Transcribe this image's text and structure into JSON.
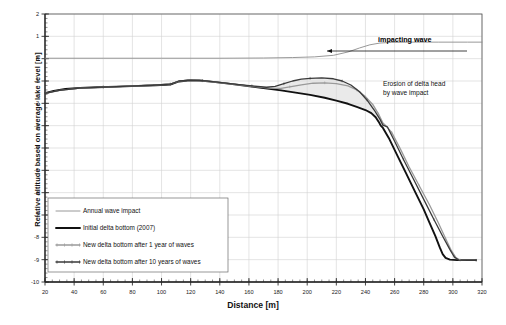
{
  "chart_data": {
    "type": "line",
    "title": "",
    "xlabel": "Distance [m]",
    "ylabel": "Relative altitude based on average lake level [m]",
    "xlim": [
      20,
      320
    ],
    "ylim": [
      -10,
      2
    ],
    "xticks": [
      20,
      40,
      60,
      80,
      100,
      120,
      140,
      160,
      180,
      200,
      220,
      240,
      260,
      280,
      300,
      320
    ],
    "yticks": [
      2,
      1,
      0,
      -1,
      -2,
      -3,
      -4,
      -5,
      -6,
      -7,
      -8,
      -9,
      -10
    ],
    "xtick_labels": [
      "20",
      "40",
      "60",
      "80",
      "100",
      "120",
      "140",
      "160",
      "180",
      "200",
      "220",
      "240",
      "260",
      "280",
      "300",
      "320"
    ],
    "ytick_labels": [
      "2",
      "1",
      "0",
      "-1",
      "-2",
      "-3",
      "-4",
      "-5",
      "-6",
      "-7",
      "-8",
      "-9",
      "-10"
    ],
    "grid": true,
    "legend_position": "lower-left",
    "minor_tick_interval_y": 0.2,
    "minor_tick_interval_x": 5,
    "series": [
      {
        "name": "Annual wave impact",
        "color": "#8c8c8c",
        "width": 0.9,
        "style": "plain",
        "points": [
          [
            20,
            0.02
          ],
          [
            60,
            0.02
          ],
          [
            100,
            0.02
          ],
          [
            140,
            0.02
          ],
          [
            170,
            0.03
          ],
          [
            190,
            0.05
          ],
          [
            205,
            0.08
          ],
          [
            218,
            0.15
          ],
          [
            228,
            0.3
          ],
          [
            236,
            0.48
          ],
          [
            243,
            0.62
          ],
          [
            250,
            0.7
          ],
          [
            258,
            0.73
          ],
          [
            270,
            0.74
          ],
          [
            290,
            0.74
          ],
          [
            310,
            0.74
          ],
          [
            320,
            0.74
          ]
        ]
      },
      {
        "name": "Initial delta bottom (2007)",
        "color": "#111111",
        "width": 1.9,
        "style": "plain",
        "points": [
          [
            20,
            -1.55
          ],
          [
            26,
            -1.44
          ],
          [
            34,
            -1.36
          ],
          [
            44,
            -1.31
          ],
          [
            56,
            -1.28
          ],
          [
            70,
            -1.25
          ],
          [
            84,
            -1.22
          ],
          [
            96,
            -1.19
          ],
          [
            106,
            -1.16
          ],
          [
            112,
            -1.02
          ],
          [
            118,
            -0.98
          ],
          [
            126,
            -0.98
          ],
          [
            134,
            -1.03
          ],
          [
            146,
            -1.12
          ],
          [
            158,
            -1.22
          ],
          [
            170,
            -1.32
          ],
          [
            182,
            -1.42
          ],
          [
            192,
            -1.52
          ],
          [
            202,
            -1.62
          ],
          [
            212,
            -1.75
          ],
          [
            220,
            -1.88
          ],
          [
            228,
            -2.02
          ],
          [
            234,
            -2.16
          ],
          [
            240,
            -2.3
          ],
          [
            244,
            -2.44
          ],
          [
            247,
            -2.62
          ],
          [
            249,
            -2.82
          ],
          [
            250.5,
            -3.0
          ],
          [
            252,
            -3.1
          ],
          [
            256,
            -3.55
          ],
          [
            262,
            -4.35
          ],
          [
            268,
            -5.15
          ],
          [
            274,
            -5.95
          ],
          [
            280,
            -6.75
          ],
          [
            284,
            -7.35
          ],
          [
            288,
            -7.95
          ],
          [
            291,
            -8.45
          ],
          [
            293,
            -8.75
          ],
          [
            295,
            -8.92
          ],
          [
            298,
            -9.0
          ],
          [
            303,
            -9.02
          ],
          [
            310,
            -9.02
          ],
          [
            316,
            -9.02
          ]
        ]
      },
      {
        "name": "New delta bottom after 1 year of waves",
        "color": "#9a9a9a",
        "width": 1.3,
        "style": "ticked",
        "points": [
          [
            20,
            -1.55
          ],
          [
            30,
            -1.42
          ],
          [
            44,
            -1.32
          ],
          [
            60,
            -1.27
          ],
          [
            78,
            -1.23
          ],
          [
            94,
            -1.19
          ],
          [
            106,
            -1.14
          ],
          [
            112,
            -1.01
          ],
          [
            120,
            -0.97
          ],
          [
            128,
            -0.99
          ],
          [
            138,
            -1.06
          ],
          [
            150,
            -1.15
          ],
          [
            162,
            -1.24
          ],
          [
            174,
            -1.32
          ],
          [
            182,
            -1.33
          ],
          [
            188,
            -1.26
          ],
          [
            196,
            -1.17
          ],
          [
            204,
            -1.1
          ],
          [
            212,
            -1.08
          ],
          [
            220,
            -1.12
          ],
          [
            228,
            -1.22
          ],
          [
            234,
            -1.4
          ],
          [
            240,
            -1.7
          ],
          [
            245,
            -2.05
          ],
          [
            249,
            -2.48
          ],
          [
            252,
            -2.88
          ],
          [
            254,
            -3.0
          ],
          [
            258,
            -3.3
          ],
          [
            264,
            -4.05
          ],
          [
            270,
            -4.85
          ],
          [
            277,
            -5.7
          ],
          [
            284,
            -6.55
          ],
          [
            290,
            -7.35
          ],
          [
            295,
            -8.05
          ],
          [
            299,
            -8.6
          ],
          [
            302,
            -8.9
          ],
          [
            305,
            -9.02
          ],
          [
            310,
            -9.03
          ],
          [
            316,
            -9.03
          ]
        ]
      },
      {
        "name": "New delta bottom after 10 years of waves",
        "color": "#3a3a3a",
        "width": 1.3,
        "style": "ticked",
        "points": [
          [
            20,
            -1.55
          ],
          [
            30,
            -1.42
          ],
          [
            44,
            -1.32
          ],
          [
            60,
            -1.27
          ],
          [
            78,
            -1.23
          ],
          [
            94,
            -1.19
          ],
          [
            106,
            -1.14
          ],
          [
            112,
            -1.0
          ],
          [
            120,
            -0.96
          ],
          [
            128,
            -0.98
          ],
          [
            138,
            -1.05
          ],
          [
            150,
            -1.14
          ],
          [
            162,
            -1.22
          ],
          [
            172,
            -1.28
          ],
          [
            178,
            -1.24
          ],
          [
            184,
            -1.12
          ],
          [
            190,
            -1.0
          ],
          [
            196,
            -0.92
          ],
          [
            202,
            -0.88
          ],
          [
            210,
            -0.86
          ],
          [
            218,
            -0.9
          ],
          [
            224,
            -1.0
          ],
          [
            230,
            -1.18
          ],
          [
            236,
            -1.48
          ],
          [
            241,
            -1.85
          ],
          [
            246,
            -2.3
          ],
          [
            250,
            -2.72
          ],
          [
            252,
            -2.98
          ],
          [
            255,
            -3.05
          ],
          [
            260,
            -3.7
          ],
          [
            266,
            -4.5
          ],
          [
            273,
            -5.4
          ],
          [
            280,
            -6.3
          ],
          [
            287,
            -7.2
          ],
          [
            293,
            -7.95
          ],
          [
            298,
            -8.55
          ],
          [
            301,
            -8.88
          ],
          [
            304,
            -9.02
          ],
          [
            310,
            -9.03
          ],
          [
            316,
            -9.03
          ]
        ]
      }
    ],
    "shaded_region": {
      "name": "erosion-area",
      "fill": "#d9d9d9",
      "opacity": 0.55
    },
    "annotations": [
      {
        "name": "impacting-wave",
        "text": "impacting wave",
        "bold": true
      },
      {
        "name": "erosion-line-1",
        "text": "Erosion of delta head",
        "bold": false
      },
      {
        "name": "erosion-line-2",
        "text": "by wave impact",
        "bold": false
      }
    ]
  },
  "legend": {
    "items": [
      {
        "label": "Annual wave impact"
      },
      {
        "label": "Initial delta bottom (2007)"
      },
      {
        "label": "New delta bottom after 1 year of waves"
      },
      {
        "label": "New delta bottom after 10 years of waves"
      }
    ]
  },
  "colors": {
    "axis": "#222222",
    "grid": "#d2d2d2",
    "frame": "#555555",
    "wave": "#8c8c8c",
    "initial": "#111111",
    "year1": "#9a9a9a",
    "year10": "#3a3a3a",
    "erosion_fill": "#d9d9d9"
  }
}
